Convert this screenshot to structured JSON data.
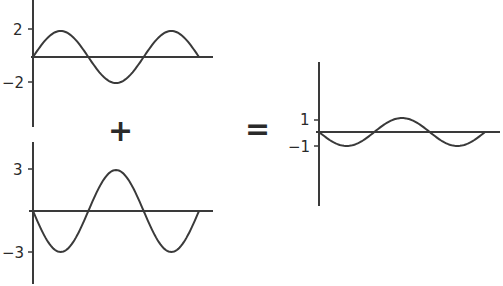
{
  "colors": {
    "line": "#3a3a3a",
    "background": "#ffffff"
  },
  "operators": {
    "plus": "+",
    "equals": "="
  },
  "waves": [
    {
      "id": "wave-a",
      "amplitude": 2,
      "phase": "sine",
      "tick_labels": [
        "2",
        "−2"
      ]
    },
    {
      "id": "wave-b",
      "amplitude": -3,
      "phase": "inverted-sine",
      "tick_labels": [
        "3",
        "−3"
      ]
    },
    {
      "id": "wave-sum",
      "amplitude": -1,
      "phase": "inverted-sine",
      "tick_labels": [
        "1",
        "−1"
      ]
    }
  ],
  "chart_data": [
    {
      "type": "line",
      "title": "",
      "xlabel": "",
      "ylabel": "",
      "series": [
        {
          "name": "y = 2 sin x",
          "function": "2*sin(x)",
          "cycles": 1.5
        }
      ],
      "yticks": [
        2,
        -2
      ],
      "ylim": [
        -4.5,
        4.5
      ],
      "grid": false
    },
    {
      "type": "line",
      "title": "",
      "xlabel": "",
      "ylabel": "",
      "series": [
        {
          "name": "y = -3 sin x",
          "function": "-3*sin(x)",
          "cycles": 1.5
        }
      ],
      "yticks": [
        3,
        -3
      ],
      "ylim": [
        -5,
        5
      ],
      "grid": false
    },
    {
      "type": "line",
      "title": "",
      "xlabel": "",
      "ylabel": "",
      "series": [
        {
          "name": "y = -sin x",
          "function": "-sin(x)",
          "cycles": 1.5
        }
      ],
      "yticks": [
        1,
        -1
      ],
      "ylim": [
        -6,
        6
      ],
      "grid": false
    }
  ]
}
